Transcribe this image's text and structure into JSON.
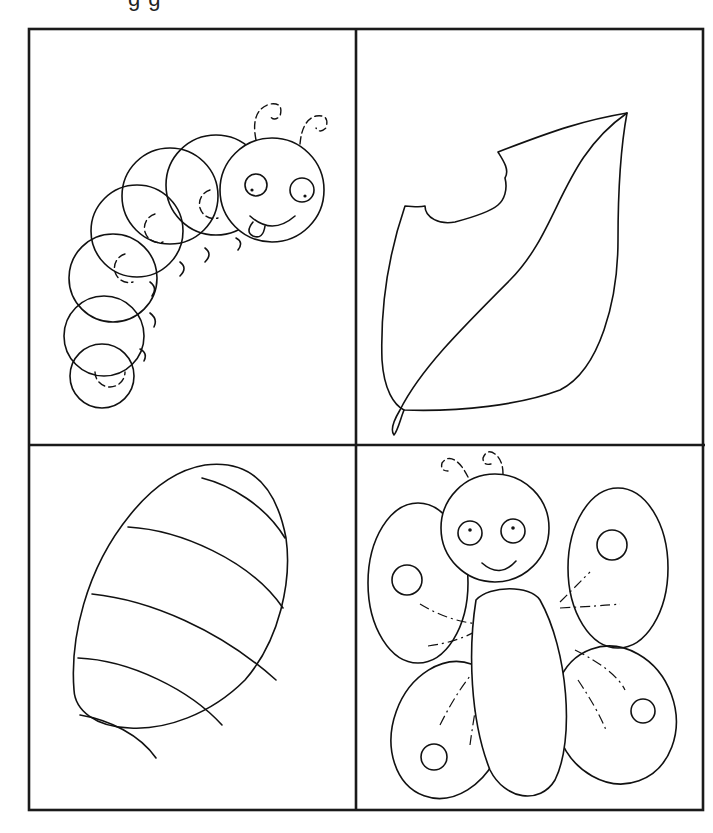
{
  "page": {
    "title_fragment": "g g"
  },
  "panels": [
    {
      "id": "caterpillar",
      "label": "Caterpillar"
    },
    {
      "id": "leaf",
      "label": "Eaten leaf"
    },
    {
      "id": "cocoon",
      "label": "Cocoon"
    },
    {
      "id": "butterfly",
      "label": "Butterfly"
    }
  ],
  "colors": {
    "line": "#111111",
    "background": "#ffffff"
  }
}
